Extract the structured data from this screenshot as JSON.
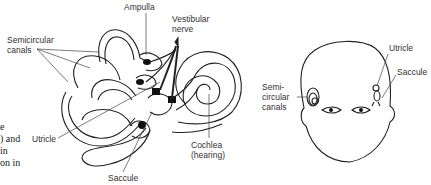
{
  "diagram": {
    "left_figure": {
      "labels": {
        "ampulla": "Ampulla",
        "vestibular_nerve_1": "Vestibular",
        "vestibular_nerve_2": "nerve",
        "semicircular_1": "Semicircular",
        "semicircular_2": "canals",
        "utricle": "Utricle",
        "saccule": "Saccule",
        "cochlea_1": "Cochlea",
        "cochlea_2": "(hearing)"
      }
    },
    "right_figure": {
      "labels": {
        "utricle": "Utricle",
        "saccule": "Saccule",
        "semi_1": "Semi-",
        "semi_2": "circular",
        "semi_3": "canals"
      }
    },
    "cut_off_text": [
      "e",
      ") and",
      "in",
      "on in"
    ]
  }
}
